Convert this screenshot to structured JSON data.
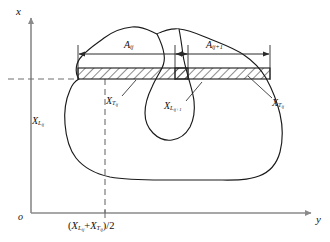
{
  "figure": {
    "type": "technical-diagram",
    "axes": {
      "x_label": "x",
      "y_label": "y",
      "origin_label": "o",
      "x_axis_orientation": "vertical-up",
      "y_axis_orientation": "horizontal-right"
    },
    "dimensions": [
      {
        "id": "A_ij",
        "base": "A",
        "sub": "ij",
        "label": "A_ij"
      },
      {
        "id": "A_ij1",
        "base": "A",
        "sub": "ij+1",
        "label": "A_ij+1"
      }
    ],
    "callouts": [
      {
        "id": "XL_ij",
        "base": "X",
        "sub": "L",
        "subsub": "ij",
        "label": "X_Lij"
      },
      {
        "id": "XT_ij_left",
        "base": "X",
        "sub": "T",
        "subsub": "ij",
        "label": "X_Tij"
      },
      {
        "id": "XL_ij1",
        "base": "X",
        "sub": "L",
        "subsub": "ij+1",
        "label": "X_Lij+1"
      },
      {
        "id": "XT_ij_right",
        "base": "X",
        "sub": "T",
        "subsub": "ij",
        "label": "X_Tij"
      }
    ],
    "midline": {
      "open": "(",
      "term1_base": "X",
      "term1_sub": "L",
      "term1_subsub": "ij",
      "plus": "+",
      "term2_base": "X",
      "term2_sub": "T",
      "term2_subsub": "ij",
      "close": ")/2",
      "label": "(X_Lij + X_Tij)/2"
    },
    "colors": {
      "axis": "#8a8a8a",
      "outline": "#1a1a1a",
      "dashed": "#6e6e6e",
      "hatch": "#1a1a1a",
      "leader": "#2a2a2a",
      "background": "#ffffff"
    },
    "hatched_areas": [
      {
        "id": "A_ij",
        "x": 78,
        "y": 68,
        "width": 110,
        "height": 11
      },
      {
        "id": "A_ij1",
        "x": 175,
        "y": 68,
        "width": 95,
        "height": 11
      }
    ]
  }
}
